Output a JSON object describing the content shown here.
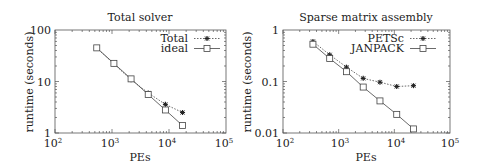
{
  "chart_data": [
    {
      "type": "line",
      "title": "Total solver",
      "xlabel": "PEs",
      "ylabel": "runtime (seconds)",
      "xscale": "log",
      "yscale": "log",
      "xlim": [
        100,
        100000
      ],
      "ylim": [
        1,
        100
      ],
      "x_tick_labels": [
        "10^2",
        "10^3",
        "10^4",
        "10^5"
      ],
      "y_tick_labels": [
        "1",
        "10",
        "100"
      ],
      "legend_position": "upper right",
      "grid": false,
      "x": [
        540,
        1080,
        2160,
        4320,
        8640,
        17280
      ],
      "series": [
        {
          "name": "Total",
          "marker": "asterisk",
          "line": "dotted",
          "values": [
            45,
            22,
            10.8,
            6.0,
            3.6,
            2.5
          ]
        },
        {
          "name": "ideal",
          "marker": "open-square",
          "line": "solid",
          "values": [
            45,
            22.5,
            11.25,
            5.6,
            2.8,
            1.4
          ]
        }
      ]
    },
    {
      "type": "line",
      "title": "Sparse matrix assembly",
      "xlabel": "PEs",
      "ylabel": "runtime (seconds)",
      "xscale": "log",
      "yscale": "log",
      "xlim": [
        100,
        100000
      ],
      "ylim": [
        0.01,
        1
      ],
      "x_tick_labels": [
        "10^2",
        "10^3",
        "10^4",
        "10^5"
      ],
      "y_tick_labels": [
        "0.01",
        "0.1",
        "1"
      ],
      "legend_position": "upper right",
      "grid": false,
      "x": [
        345,
        690,
        1380,
        2760,
        5520,
        11040,
        22080
      ],
      "series": [
        {
          "name": "PETSc",
          "marker": "asterisk",
          "line": "dotted",
          "values": [
            0.6,
            0.33,
            0.19,
            0.115,
            0.097,
            0.08,
            0.083
          ]
        },
        {
          "name": "JANPACK",
          "marker": "open-square",
          "line": "solid",
          "values": [
            0.53,
            0.28,
            0.155,
            0.078,
            0.042,
            0.023,
            0.012
          ]
        }
      ]
    }
  ],
  "charts": [
    {
      "title": "Total solver",
      "xlabel": "PEs",
      "ylabel": "runtime (seconds)",
      "y_ticks": [
        "100",
        "10",
        "1"
      ],
      "x_ticks": [
        {
          "base": "10",
          "exp": "2"
        },
        {
          "base": "10",
          "exp": "3"
        },
        {
          "base": "10",
          "exp": "4"
        },
        {
          "base": "10",
          "exp": "5"
        }
      ],
      "legend": [
        "Total",
        "ideal"
      ]
    },
    {
      "title": "Sparse matrix assembly",
      "xlabel": "PEs",
      "ylabel": "runtime (seconds)",
      "y_ticks": [
        "1",
        "0.1",
        "0.01"
      ],
      "x_ticks": [
        {
          "base": "10",
          "exp": "2"
        },
        {
          "base": "10",
          "exp": "3"
        },
        {
          "base": "10",
          "exp": "4"
        },
        {
          "base": "10",
          "exp": "5"
        }
      ],
      "legend": [
        "PETSc",
        "JANPACK"
      ]
    }
  ],
  "colors": {
    "line": "#444444",
    "frame": "#555555",
    "text": "#222222"
  }
}
